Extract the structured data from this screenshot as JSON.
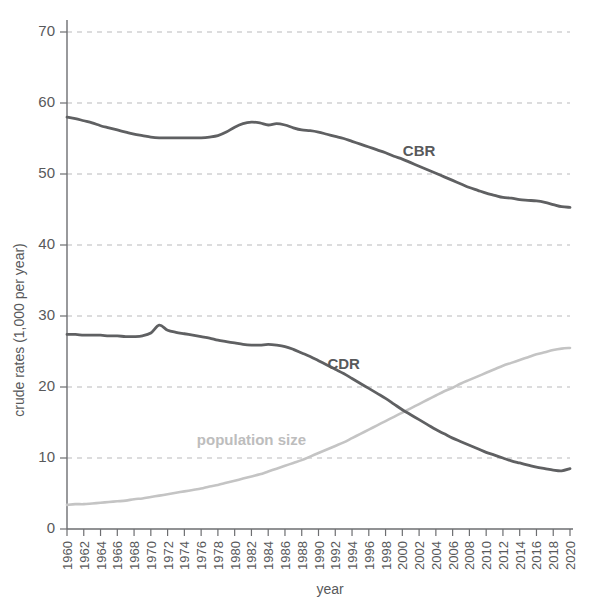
{
  "chart_data": {
    "type": "line",
    "title": "",
    "subtitle": "",
    "xlabel": "year",
    "ylabel": "crude rates (1,000 per year)",
    "xlim": [
      1960,
      2020
    ],
    "ylim": [
      0,
      70
    ],
    "grid": true,
    "legend_position": "inline-annotations",
    "xticks": [
      "1960",
      "1962",
      "1964",
      "1966",
      "1968",
      "1970",
      "1972",
      "1974",
      "1976",
      "1978",
      "1980",
      "1982",
      "1984",
      "1986",
      "1988",
      "1990",
      "1992",
      "1994",
      "1996",
      "1998",
      "2000",
      "2002",
      "2004",
      "2006",
      "2008",
      "2010",
      "2012",
      "2014",
      "2016",
      "2018",
      "2020"
    ],
    "yticks": [
      "0",
      "10",
      "20",
      "30",
      "40",
      "50",
      "60",
      "70"
    ],
    "x": [
      1960,
      1961,
      1962,
      1963,
      1964,
      1965,
      1966,
      1967,
      1968,
      1969,
      1970,
      1971,
      1972,
      1973,
      1974,
      1975,
      1976,
      1977,
      1978,
      1979,
      1980,
      1981,
      1982,
      1983,
      1984,
      1985,
      1986,
      1987,
      1988,
      1989,
      1990,
      1991,
      1992,
      1993,
      1994,
      1995,
      1996,
      1997,
      1998,
      1999,
      2000,
      2001,
      2002,
      2003,
      2004,
      2005,
      2006,
      2007,
      2008,
      2009,
      2010,
      2011,
      2012,
      2013,
      2014,
      2015,
      2016,
      2017,
      2018,
      2019,
      2020
    ],
    "series": [
      {
        "name": "CBR",
        "label": "CBR",
        "color": "#5f6062",
        "values": [
          58.0,
          57.8,
          57.5,
          57.2,
          56.8,
          56.5,
          56.2,
          55.9,
          55.6,
          55.4,
          55.2,
          55.1,
          55.1,
          55.1,
          55.1,
          55.1,
          55.1,
          55.2,
          55.4,
          55.9,
          56.6,
          57.1,
          57.3,
          57.2,
          56.9,
          57.1,
          56.9,
          56.5,
          56.2,
          56.1,
          55.9,
          55.6,
          55.3,
          55.0,
          54.6,
          54.2,
          53.8,
          53.4,
          53.0,
          52.5,
          52.1,
          51.6,
          51.1,
          50.6,
          50.1,
          49.6,
          49.1,
          48.6,
          48.1,
          47.7,
          47.3,
          47.0,
          46.7,
          46.6,
          46.4,
          46.3,
          46.2,
          46.0,
          45.7,
          45.4,
          45.3
        ]
      },
      {
        "name": "CDR",
        "label": "CDR",
        "color": "#5f6062",
        "values": [
          27.4,
          27.4,
          27.3,
          27.3,
          27.3,
          27.2,
          27.2,
          27.1,
          27.1,
          27.2,
          27.6,
          28.7,
          28.0,
          27.7,
          27.5,
          27.3,
          27.1,
          26.9,
          26.6,
          26.4,
          26.2,
          26.0,
          25.9,
          25.9,
          26.0,
          25.9,
          25.7,
          25.3,
          24.8,
          24.3,
          23.7,
          23.1,
          22.5,
          21.9,
          21.2,
          20.5,
          19.8,
          19.1,
          18.4,
          17.6,
          16.8,
          16.1,
          15.4,
          14.7,
          14.0,
          13.4,
          12.8,
          12.3,
          11.8,
          11.3,
          10.8,
          10.4,
          10.0,
          9.6,
          9.3,
          9.0,
          8.7,
          8.5,
          8.3,
          8.2,
          8.5
        ]
      },
      {
        "name": "population size",
        "label": "population size",
        "color": "#c4c4c4",
        "values": [
          3.4,
          3.5,
          3.5,
          3.6,
          3.7,
          3.8,
          3.9,
          4.0,
          4.2,
          4.3,
          4.5,
          4.7,
          4.9,
          5.1,
          5.3,
          5.5,
          5.7,
          6.0,
          6.2,
          6.5,
          6.8,
          7.1,
          7.4,
          7.7,
          8.1,
          8.5,
          8.9,
          9.3,
          9.7,
          10.2,
          10.7,
          11.2,
          11.7,
          12.2,
          12.8,
          13.4,
          14.0,
          14.6,
          15.2,
          15.8,
          16.4,
          17.0,
          17.6,
          18.2,
          18.8,
          19.4,
          19.9,
          20.5,
          21.0,
          21.5,
          22.0,
          22.5,
          23.0,
          23.4,
          23.8,
          24.2,
          24.6,
          24.9,
          25.2,
          25.4,
          25.5
        ]
      }
    ],
    "annotations": [
      {
        "text": "CBR",
        "x": 2002,
        "y": 52.5
      },
      {
        "text": "CDR",
        "x": 1993,
        "y": 22.6
      },
      {
        "text": "population size",
        "x": 1982,
        "y": 11.8
      }
    ]
  }
}
